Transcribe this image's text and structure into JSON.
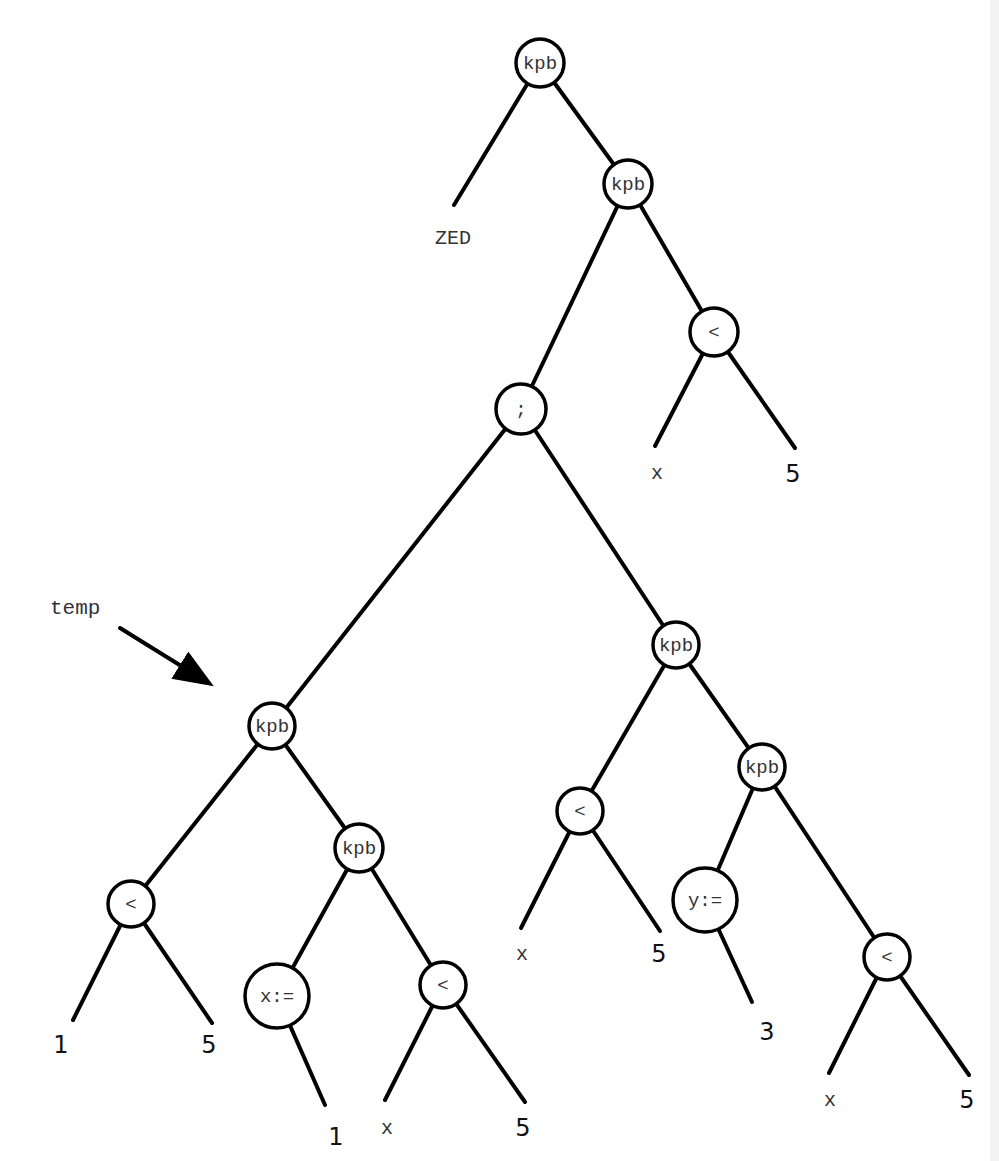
{
  "diagram": {
    "type": "syntax-tree",
    "annotation": {
      "label": "temp",
      "label_pos": [
        50,
        614
      ],
      "arrow_from": [
        120,
        628
      ],
      "arrow_to": [
        215,
        687
      ],
      "points_to": "n_kpb_temp"
    },
    "nodes": [
      {
        "id": "n_root",
        "label": "kpb",
        "x": 540,
        "y": 63,
        "r": 24
      },
      {
        "id": "n_kpb2",
        "label": "kpb",
        "x": 628,
        "y": 184,
        "r": 24
      },
      {
        "id": "n_lt_top",
        "label": "<",
        "x": 714,
        "y": 332,
        "r": 24
      },
      {
        "id": "n_semi",
        "label": ";",
        "x": 521,
        "y": 409,
        "r": 25
      },
      {
        "id": "n_kpb_temp",
        "label": "kpb",
        "x": 272,
        "y": 726,
        "r": 23
      },
      {
        "id": "n_kpb_rmid",
        "label": "kpb",
        "x": 676,
        "y": 645,
        "r": 23
      },
      {
        "id": "n_lt_a",
        "label": "<",
        "x": 131,
        "y": 904,
        "r": 23
      },
      {
        "id": "n_kpb_lmid",
        "label": "kpb",
        "x": 359,
        "y": 848,
        "r": 24
      },
      {
        "id": "n_assign_x",
        "label": "x:=",
        "x": 277,
        "y": 996,
        "r": 32
      },
      {
        "id": "n_lt_b",
        "label": "<",
        "x": 443,
        "y": 985,
        "r": 23
      },
      {
        "id": "n_lt_c",
        "label": "<",
        "x": 580,
        "y": 811,
        "r": 23
      },
      {
        "id": "n_kpb_rlow",
        "label": "kpb",
        "x": 762,
        "y": 767,
        "r": 23
      },
      {
        "id": "n_assign_y",
        "label": "y:=",
        "x": 705,
        "y": 900,
        "r": 32
      },
      {
        "id": "n_lt_d",
        "label": "<",
        "x": 887,
        "y": 957,
        "r": 23
      }
    ],
    "leaves": [
      {
        "id": "l_zed",
        "label": "ZED",
        "style": "mono",
        "x": 453,
        "y": 244,
        "end": [
          454,
          205
        ],
        "parent": "n_root"
      },
      {
        "id": "l_x1",
        "label": "x",
        "style": "mono",
        "x": 657,
        "y": 479,
        "end": [
          655,
          446
        ],
        "parent": "n_lt_top"
      },
      {
        "id": "l_5a",
        "label": "5",
        "style": "num",
        "x": 793,
        "y": 482,
        "end": [
          795,
          448
        ],
        "parent": "n_lt_top"
      },
      {
        "id": "l_1a",
        "label": "1",
        "style": "num",
        "x": 61,
        "y": 1053,
        "end": [
          73,
          1020
        ],
        "parent": "n_lt_a"
      },
      {
        "id": "l_5b",
        "label": "5",
        "style": "num",
        "x": 209,
        "y": 1053,
        "end": [
          212,
          1023
        ],
        "parent": "n_lt_a"
      },
      {
        "id": "l_1b",
        "label": "1",
        "style": "num",
        "x": 336,
        "y": 1145,
        "end": [
          325,
          1105
        ],
        "parent": "n_assign_x"
      },
      {
        "id": "l_x2",
        "label": "x",
        "style": "mono",
        "x": 387,
        "y": 1134,
        "end": [
          385,
          1100
        ],
        "parent": "n_lt_b"
      },
      {
        "id": "l_5c",
        "label": "5",
        "style": "num",
        "x": 523,
        "y": 1136,
        "end": [
          525,
          1102
        ],
        "parent": "n_lt_b"
      },
      {
        "id": "l_x3",
        "label": "x",
        "style": "mono",
        "x": 522,
        "y": 960,
        "end": [
          521,
          928
        ],
        "parent": "n_lt_c"
      },
      {
        "id": "l_5d",
        "label": "5",
        "style": "num",
        "x": 659,
        "y": 962,
        "end": [
          660,
          931
        ],
        "parent": "n_lt_c"
      },
      {
        "id": "l_3",
        "label": "3",
        "style": "num",
        "x": 767,
        "y": 1040,
        "end": [
          752,
          1002
        ],
        "parent": "n_assign_y"
      },
      {
        "id": "l_x4",
        "label": "x",
        "style": "mono",
        "x": 830,
        "y": 1106,
        "end": [
          829,
          1073
        ],
        "parent": "n_lt_d"
      },
      {
        "id": "l_5e",
        "label": "5",
        "style": "num",
        "x": 967,
        "y": 1108,
        "end": [
          969,
          1075
        ],
        "parent": "n_lt_d"
      }
    ],
    "edges": [
      [
        "n_root",
        "n_kpb2"
      ],
      [
        "n_kpb2",
        "n_semi"
      ],
      [
        "n_kpb2",
        "n_lt_top"
      ],
      [
        "n_semi",
        "n_kpb_temp"
      ],
      [
        "n_semi",
        "n_kpb_rmid"
      ],
      [
        "n_kpb_temp",
        "n_lt_a"
      ],
      [
        "n_kpb_temp",
        "n_kpb_lmid"
      ],
      [
        "n_kpb_lmid",
        "n_assign_x"
      ],
      [
        "n_kpb_lmid",
        "n_lt_b"
      ],
      [
        "n_kpb_rmid",
        "n_lt_c"
      ],
      [
        "n_kpb_rmid",
        "n_kpb_rlow"
      ],
      [
        "n_kpb_rlow",
        "n_assign_y"
      ],
      [
        "n_kpb_rlow",
        "n_lt_d"
      ]
    ]
  }
}
